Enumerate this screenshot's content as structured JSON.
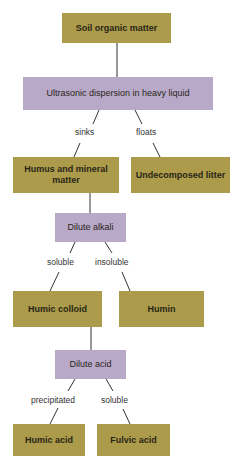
{
  "diagram": {
    "type": "flowchart",
    "colors": {
      "result_box": "#ab9b4a",
      "process_box": "#b9a9c8",
      "line": "#333333"
    },
    "nodes": {
      "soil": "Soil organic matter",
      "ultrasonic": "Ultrasonic dispersion in heavy liquid",
      "humus_mineral": "Humus and mineral matter",
      "undecomposed": "Undecomposed litter",
      "alkali": "Dilute alkali",
      "humic_colloid": "Humic colloid",
      "humin": "Humin",
      "acid": "Dilute acid",
      "humic_acid": "Humic acid",
      "fulvic_acid": "Fulvic acid"
    },
    "edge_labels": {
      "sinks": "sinks",
      "floats": "floats",
      "soluble_1": "soluble",
      "insoluble": "insoluble",
      "precipitated": "precipitated",
      "soluble_2": "soluble"
    }
  }
}
